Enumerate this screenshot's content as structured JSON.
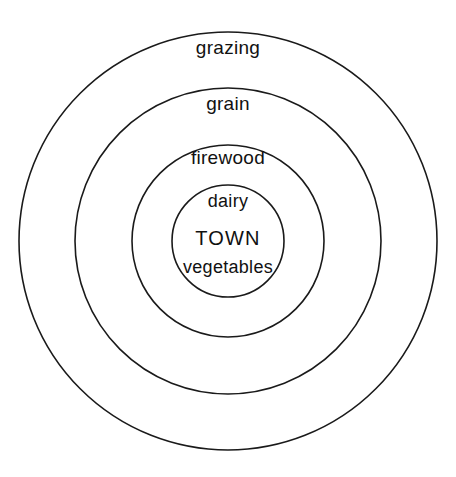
{
  "diagram": {
    "type": "concentric-circles",
    "background_color": "#ffffff",
    "stroke_color": "#1a1a1a",
    "text_color": "#111111",
    "center": {
      "x": 228,
      "y": 241
    },
    "rings": [
      {
        "id": "grazing",
        "label": "grazing",
        "radius": 209,
        "label_x": 228,
        "label_y": 38,
        "order": 4
      },
      {
        "id": "grain",
        "label": "grain",
        "radius": 153,
        "label_x": 228,
        "label_y": 94,
        "order": 3
      },
      {
        "id": "firewood",
        "label": "firewood",
        "radius": 96,
        "label_x": 228,
        "label_y": 148,
        "order": 2
      },
      {
        "id": "town",
        "label": "TOWN",
        "radius": 56,
        "label_x": 228,
        "label_y": 230,
        "order": 1
      }
    ],
    "inner_labels": [
      {
        "id": "dairy",
        "label": "dairy",
        "x": 228,
        "y": 192
      },
      {
        "id": "town",
        "label": "TOWN",
        "x": 228,
        "y": 228
      },
      {
        "id": "vegetables",
        "label": "vegetables",
        "x": 228,
        "y": 258
      }
    ]
  },
  "chart_data": {
    "type": "pie",
    "categories": [
      "TOWN",
      "vegetables",
      "dairy",
      "firewood",
      "grain",
      "grazing"
    ],
    "values": [
      56,
      56,
      56,
      96,
      153,
      209
    ],
    "ylabel": "radius (px)",
    "xlabel": "zone",
    "legend": "none",
    "grid": false,
    "annotations": [
      "Innermost circle contains dairy, TOWN and vegetables",
      "Second ring is firewood",
      "Third ring is grain",
      "Outermost ring is grazing"
    ]
  }
}
